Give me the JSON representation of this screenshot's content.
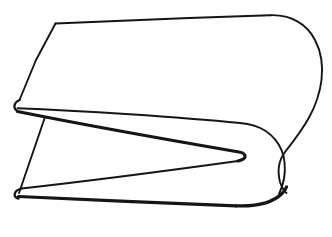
{
  "image": {
    "title": "Folded sheet line drawing",
    "kind": "line-art-diagram",
    "subject": "folded-strip",
    "width": 332,
    "height": 237,
    "background_color": "#ffffff",
    "stroke_color": "#151515",
    "caption": ""
  },
  "style": {
    "stroke_thin": 1.9,
    "stroke_medium": 2.3,
    "stroke_thick": 3.2,
    "fill_color": "#ffffff"
  },
  "geometry": {
    "upper_face_fill": "M 55 23 L 271 15 C 300 14 322 37 322 68 C 322 100 300 122 268 130 L 18 112 C 12 110 11 104 16 101 L 55 23 Z",
    "lower_face_fill": "M 16 108 L 247 151 C 253 153 253 158 247 159 L 17 188 C 11 190 11 196 17 196 L 245 205 C 272 206 288 198 288 188 C 290 170 282 150 268 130 L 18 112 Z",
    "outline_top_edge": "M 55 23 L 162 19 L 271 15",
    "outline_top_right_curve": "M 271 15 C 296 14.5 314 30 320 52 C 323 63 323 76 320 88 C 313 112 296 126 268 130",
    "outline_left_upper_edge": "M 55 23 L 33 66 L 19 100",
    "outline_left_upper_fold": "M 19 100 C 12.5 103 12 109.5 18.5 112",
    "outline_upper_inner_edge": "M 18 112 L 150 120 L 250 126 L 268 130",
    "outline_mid_right_fold": "M 250 126 C 272 128 286 142 288 161 C 290 176 287 186 281 196",
    "outline_notch_upper": "M 17 110 L 130 133 L 238 152",
    "outline_notch_tip": "M 238 152 C 248 153.5 248 158.5 238 160",
    "outline_notch_lower": "M 238 160 L 130 176 L 21 189",
    "outline_left_lower_fold": "M 21 189 C 13 191 12.5 197 19 198",
    "outline_left_lower_edge": "M 19 198 L 52 198",
    "outline_bottom_edge": "M 19 197 L 130 202 L 238 206",
    "outline_bottom_right_curve": "M 238 206 C 262 207 278 203 288 190",
    "outline_right_fold_seam": "M 288 190 C 293 176 292 158 287 144",
    "outline_left_vertical_edge": "M 45 119 L 19 194",
    "join_right_apex": "M 281 196 C 284 194 286 192 288 190"
  },
  "paths": [
    {
      "name": "top-edge",
      "d": "M 55.5 23.5 C 110 21 200 17.5 270 15.2",
      "weight": "w-thin"
    },
    {
      "name": "top-right-outer-curve",
      "d": "M 270 15.2 C 291 14.4 307 24 315 40 C 321.5 52.5 323 68 321.5 80 C 318 108 304 128 285 152 C 279 160 277 170 280 182 C 282 188 284 191 286.5 193",
      "weight": "w-thin"
    },
    {
      "name": "left-upper-slant-edge",
      "d": "M 55.5 23.5 L 36 60 L 19.5 100",
      "weight": "w-thin"
    },
    {
      "name": "left-upper-fold-round",
      "d": "M 19.5 100 C 13.5 102.5 12.8 108.5 17.5 111.2",
      "weight": "w-med"
    },
    {
      "name": "upper-surface-inner-edge",
      "d": "M 17.5 108.2 C 80 110.5 180 117 240 123 C 246 123.5 250 124.3 254 125.6",
      "weight": "w-thin"
    },
    {
      "name": "upper-surface-right-fold",
      "d": "M 254 125.6 C 272 131 283 146 284.5 162 C 286 176 283 186 279 194",
      "weight": "w-thin"
    },
    {
      "name": "notch-upper-edge",
      "d": "M 17.5 111.5 C 80 124 175 141 236 151.5",
      "weight": "w-thick"
    },
    {
      "name": "notch-rounded-tip",
      "d": "M 236 151.5 C 247 152.4 248.5 159 238 161",
      "weight": "w-thick"
    },
    {
      "name": "notch-lower-edge",
      "d": "M 238 161 C 180 169 80 182 21.5 188.5",
      "weight": "w-thin"
    },
    {
      "name": "left-lower-fold-round",
      "d": "M 21.5 188.5 C 13.5 190.5 12.5 197.5 18.5 198.5",
      "weight": "w-med"
    },
    {
      "name": "bottom-edge",
      "d": "M 18.5 196.5 C 80 199.5 175 203.5 236 205.8",
      "weight": "w-thick"
    },
    {
      "name": "bottom-right-curve",
      "d": "M 236 205.8 C 256 206.6 272 203.5 282 193.5 C 284 191.5 285.5 189.5 286.5 187",
      "weight": "w-thick"
    },
    {
      "name": "left-vertical-back-edge",
      "d": "M 44.5 118.5 L 31 158 L 19 193",
      "weight": "w-thin"
    }
  ]
}
